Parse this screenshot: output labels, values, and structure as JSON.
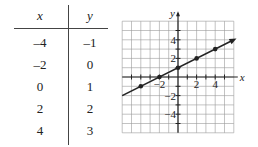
{
  "table": {
    "headers": [
      "x",
      "y"
    ],
    "rows": [
      [
        "–4",
        "–1"
      ],
      [
        "–2",
        "0"
      ],
      [
        "0",
        "1"
      ],
      [
        "2",
        "2"
      ],
      [
        "4",
        "3"
      ]
    ]
  },
  "chart_data": {
    "type": "line",
    "title": "",
    "xlabel": "x",
    "ylabel": "y",
    "xlim": [
      -6,
      6
    ],
    "ylim": [
      -6,
      6
    ],
    "grid": true,
    "x_ticks": [
      -2,
      2,
      4
    ],
    "y_ticks": [
      4,
      2,
      -2,
      -4
    ],
    "x_tick_labels": [
      "−2",
      "2",
      "4"
    ],
    "y_tick_labels": [
      "4",
      "2",
      "−2",
      "−4"
    ],
    "series": [
      {
        "name": "y = x/2 + 1",
        "points": [
          [
            -4,
            -1
          ],
          [
            -2,
            0
          ],
          [
            0,
            1
          ],
          [
            2,
            2
          ],
          [
            4,
            3
          ]
        ],
        "line_extent": [
          [
            -6,
            -2
          ],
          [
            6,
            4
          ]
        ],
        "arrow_end": "right"
      }
    ],
    "colors": {
      "line": "#222222",
      "grid": "#9a9a9a",
      "axes": "#222222"
    }
  }
}
